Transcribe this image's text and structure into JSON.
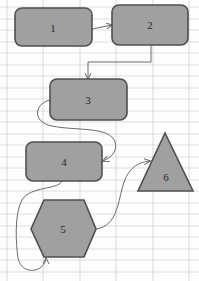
{
  "diagram": {
    "type": "flowchart",
    "colors": {
      "shape_fill": "#a0a0a0",
      "shape_stroke": "#4f4f4f",
      "connector": "#6a6a6a",
      "grid": "#d6d6d6",
      "background": "#fdfdfd"
    },
    "nodes": [
      {
        "id": "1",
        "label": "1",
        "shape": "rounded-rectangle"
      },
      {
        "id": "2",
        "label": "2",
        "shape": "rounded-rectangle"
      },
      {
        "id": "3",
        "label": "3",
        "shape": "rounded-rectangle"
      },
      {
        "id": "4",
        "label": "4",
        "shape": "rounded-rectangle"
      },
      {
        "id": "5",
        "label": "5",
        "shape": "hexagon"
      },
      {
        "id": "6",
        "label": "6",
        "shape": "triangle"
      }
    ],
    "edges": [
      {
        "from": "1",
        "to": "2",
        "style": "straight-arrow"
      },
      {
        "from": "2",
        "to": "3",
        "style": "elbow-arrow"
      },
      {
        "from": "3",
        "to": "4",
        "style": "curved-arrow"
      },
      {
        "from": "4",
        "to": "5",
        "style": "curved-arrow"
      },
      {
        "from": "5",
        "to": "6",
        "style": "curved-arrow"
      }
    ]
  }
}
